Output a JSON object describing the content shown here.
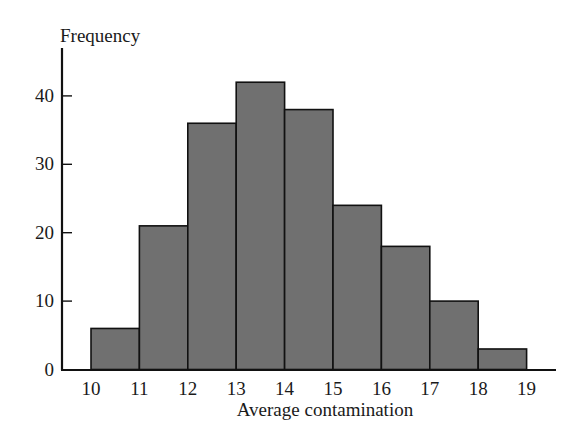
{
  "chart_data": {
    "type": "bar",
    "subtype": "histogram",
    "title": "",
    "xlabel": "Average contamination",
    "ylabel": "Frequency",
    "bin_edges": [
      10,
      11,
      12,
      13,
      14,
      15,
      16,
      17,
      18,
      19
    ],
    "categories": [
      "10-11",
      "11-12",
      "12-13",
      "13-14",
      "14-15",
      "15-16",
      "16-17",
      "17-18",
      "18-19"
    ],
    "values": [
      6,
      21,
      36,
      42,
      38,
      24,
      18,
      10,
      3
    ],
    "x_ticks": [
      "10",
      "11",
      "12",
      "13",
      "14",
      "15",
      "16",
      "17",
      "18",
      "19"
    ],
    "y_ticks": [
      0,
      10,
      20,
      30,
      40
    ],
    "ylim": [
      0,
      46
    ],
    "xlim": [
      9.4,
      19.6
    ],
    "grid": false,
    "legend": null,
    "colors": {
      "bar_fill": "#707070",
      "bar_edge": "#111111",
      "axis": "#111111",
      "text": "#1a1a1a"
    }
  }
}
